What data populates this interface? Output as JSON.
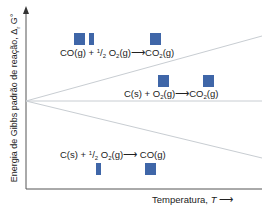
{
  "figure": {
    "y_axis_label": "Energia de Gibbs padrão de reação, Δ",
    "y_axis_sub": "r",
    "y_axis_symbol": "G°",
    "x_axis_label": "Temperatura, ",
    "x_axis_symbol": "T",
    "arrow": "⟶",
    "square_color": "#3f66a8",
    "line_color": "#c8cdd2",
    "axis_color": "#555555"
  },
  "reactions": [
    {
      "id": "co-to-co2",
      "reactant1": "CO(g)",
      "plus": "+",
      "coef": "1/2",
      "reactant2": "O",
      "reactant2_sub": "2",
      "reactant2_state": "(g)",
      "arrow": "⟶",
      "product": "CO",
      "product_sub": "2",
      "product_state": "(g)",
      "gas_moles_reactants": 1.5,
      "gas_moles_products": 1,
      "slope": "positive"
    },
    {
      "id": "c-to-co2",
      "reactant1": "C(s)",
      "plus": "+",
      "reactant2": "O",
      "reactant2_sub": "2",
      "reactant2_state": "(g)",
      "arrow": "⟶",
      "product": "CO",
      "product_sub": "2",
      "product_state": "(g)",
      "gas_moles_reactants": 1,
      "gas_moles_products": 1,
      "slope": "zero"
    },
    {
      "id": "c-to-co",
      "reactant1": "C(s)",
      "plus": "+",
      "coef": "1/2",
      "reactant2": "O",
      "reactant2_sub": "2",
      "reactant2_state": "(g)",
      "arrow": "⟶",
      "product": "CO(g)",
      "gas_moles_reactants": 0.5,
      "gas_moles_products": 1,
      "slope": "negative"
    }
  ]
}
